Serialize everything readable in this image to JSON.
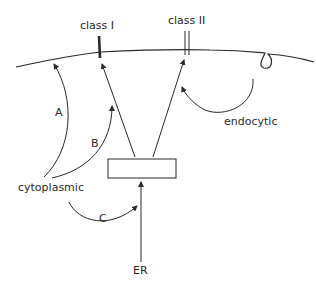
{
  "diagram": {
    "membrane": {
      "label": ""
    },
    "markers": {
      "class_one": {
        "label": "class I"
      },
      "class_two": {
        "label": "class II"
      }
    },
    "compartments": {
      "cytoplasmic": {
        "label": "cytoplasmic"
      },
      "er": {
        "label": "ER"
      },
      "central_box": {
        "label": ""
      }
    },
    "pathways": {
      "a": {
        "label": "A"
      },
      "b": {
        "label": "B"
      },
      "c": {
        "label": "C"
      },
      "endocytic": {
        "label": "endocytic"
      }
    },
    "colors": {
      "stroke": "#2a2a2a",
      "background": "#ffffff"
    }
  }
}
